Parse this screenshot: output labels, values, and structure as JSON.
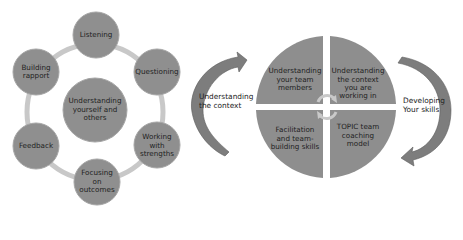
{
  "colors": {
    "node_fill": "#8f8f8f",
    "node_stroke": "#9a9a9a",
    "ring": "#c4c4c4",
    "quadrant_fill": "#8e8e8e",
    "arrow_fill": "#7d7d7d",
    "text": "#222222"
  },
  "left_diagram": {
    "center": "Understanding yourself and others",
    "nodes": [
      "Listening",
      "Questioning",
      "Working with strengths",
      "Focusing on outcomes",
      "Feedback",
      "Building rapport"
    ]
  },
  "left_arrow_label": "Understanding the context",
  "right_diagram": {
    "quadrants": [
      "Understanding your team members",
      "Understanding the context you are working in",
      "Facilitation and team-building skills",
      "TOPIC team coaching model"
    ]
  },
  "right_arrow_label": "Developing Your skills"
}
